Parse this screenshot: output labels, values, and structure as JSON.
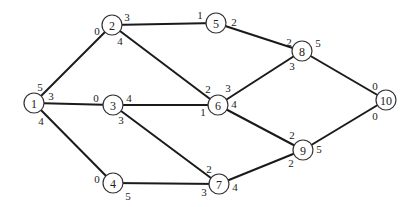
{
  "diagram": {
    "type": "network-graph",
    "nodes": [
      {
        "id": "1",
        "x": 34,
        "y": 103
      },
      {
        "id": "2",
        "x": 112,
        "y": 25
      },
      {
        "id": "3",
        "x": 113,
        "y": 105
      },
      {
        "id": "4",
        "x": 113,
        "y": 183
      },
      {
        "id": "5",
        "x": 216,
        "y": 23
      },
      {
        "id": "6",
        "x": 218,
        "y": 105
      },
      {
        "id": "7",
        "x": 219,
        "y": 184
      },
      {
        "id": "8",
        "x": 302,
        "y": 51
      },
      {
        "id": "9",
        "x": 303,
        "y": 150
      },
      {
        "id": "10",
        "x": 386,
        "y": 100
      }
    ],
    "edges": [
      {
        "from": "1",
        "to": "2"
      },
      {
        "from": "1",
        "to": "3"
      },
      {
        "from": "1",
        "to": "4"
      },
      {
        "from": "2",
        "to": "5"
      },
      {
        "from": "2",
        "to": "6"
      },
      {
        "from": "3",
        "to": "6"
      },
      {
        "from": "3",
        "to": "7"
      },
      {
        "from": "4",
        "to": "7"
      },
      {
        "from": "5",
        "to": "8"
      },
      {
        "from": "6",
        "to": "8"
      },
      {
        "from": "6",
        "to": "9"
      },
      {
        "from": "7",
        "to": "9"
      },
      {
        "from": "8",
        "to": "10"
      },
      {
        "from": "9",
        "to": "10"
      }
    ],
    "labels": [
      {
        "text": "5",
        "x": 40,
        "y": 87
      },
      {
        "text": "3",
        "x": 51,
        "y": 96
      },
      {
        "text": "4",
        "x": 41,
        "y": 121
      },
      {
        "text": "0",
        "x": 97,
        "y": 31
      },
      {
        "text": "3",
        "x": 127,
        "y": 17
      },
      {
        "text": "4",
        "x": 120,
        "y": 41
      },
      {
        "text": "0",
        "x": 96,
        "y": 98
      },
      {
        "text": "4",
        "x": 129,
        "y": 98
      },
      {
        "text": "3",
        "x": 121,
        "y": 120
      },
      {
        "text": "0",
        "x": 97,
        "y": 179
      },
      {
        "text": "5",
        "x": 128,
        "y": 196
      },
      {
        "text": "1",
        "x": 200,
        "y": 15
      },
      {
        "text": "2",
        "x": 234,
        "y": 22
      },
      {
        "text": "2",
        "x": 208,
        "y": 89
      },
      {
        "text": "3",
        "x": 228,
        "y": 88
      },
      {
        "text": "1",
        "x": 203,
        "y": 112
      },
      {
        "text": "4",
        "x": 234,
        "y": 104
      },
      {
        "text": "2",
        "x": 209,
        "y": 169
      },
      {
        "text": "3",
        "x": 204,
        "y": 192
      },
      {
        "text": "4",
        "x": 235,
        "y": 187
      },
      {
        "text": "2",
        "x": 289,
        "y": 42
      },
      {
        "text": "3",
        "x": 292,
        "y": 66
      },
      {
        "text": "5",
        "x": 318,
        "y": 43
      },
      {
        "text": "2",
        "x": 292,
        "y": 135
      },
      {
        "text": "2",
        "x": 291,
        "y": 163
      },
      {
        "text": "5",
        "x": 319,
        "y": 149
      },
      {
        "text": "0",
        "x": 375,
        "y": 86
      },
      {
        "text": "0",
        "x": 375,
        "y": 116
      }
    ]
  }
}
